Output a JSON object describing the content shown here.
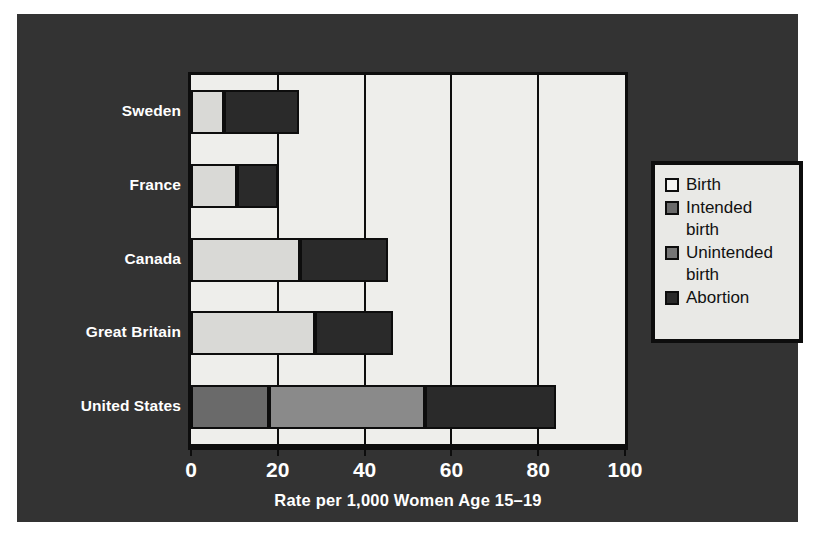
{
  "figure": {
    "background_color": "#ffffff",
    "panel_color": "#333333",
    "plot_background_color": "#eeeeeb",
    "axis_color": "#0d0d0d",
    "label_color": "#ffffff"
  },
  "axis": {
    "x_title": "Rate per 1,000 Women Age 15–19",
    "x_ticks": [
      "0",
      "20",
      "40",
      "60",
      "80",
      "100"
    ],
    "x_tick_values": [
      0,
      20,
      40,
      60,
      80,
      100
    ],
    "x_min": 0,
    "x_max": 100
  },
  "legend": {
    "items": [
      {
        "label": "Birth",
        "color": "#f4f4f2"
      },
      {
        "label": "Intended\nbirth",
        "color": "#6a6a6a"
      },
      {
        "label": "Unintended\nbirth",
        "color": "#767676"
      },
      {
        "label": "Abortion",
        "color": "#2a2a2a"
      }
    ]
  },
  "chart_data": {
    "type": "bar",
    "orientation": "horizontal",
    "stacked": true,
    "title": "",
    "xlabel": "Rate per 1,000 Women Age 15–19",
    "ylabel": "",
    "xlim": [
      0,
      100
    ],
    "grid": true,
    "legend_position": "right",
    "categories": [
      "Sweden",
      "France",
      "Canada",
      "Great Britain",
      "United States"
    ],
    "series": [
      {
        "name": "Birth",
        "color": "#f4f4f2",
        "values": [
          0,
          0,
          0,
          0,
          0
        ]
      },
      {
        "name": "Intended birth",
        "color": "#6a6a6a",
        "values": [
          0,
          0,
          0,
          0,
          18
        ]
      },
      {
        "name": "Unintended birth",
        "color": "#d9d9d6",
        "values": [
          7.5,
          10.5,
          25,
          28.5,
          36
        ]
      },
      {
        "name": "Abortion",
        "color": "#2a2a2a",
        "values": [
          17.5,
          9.5,
          20.5,
          18,
          30
        ]
      }
    ],
    "totals": [
      25,
      20,
      45.5,
      46.5,
      84
    ],
    "bars": [
      {
        "category": "Sweden",
        "segments": [
          {
            "name": "Unintended birth",
            "start": 0,
            "end": 7.5,
            "color": "#d9d9d6"
          },
          {
            "name": "Abortion",
            "start": 7.5,
            "end": 25,
            "color": "#2a2a2a"
          }
        ]
      },
      {
        "category": "France",
        "segments": [
          {
            "name": "Unintended birth",
            "start": 0,
            "end": 10.5,
            "color": "#d9d9d6"
          },
          {
            "name": "Abortion",
            "start": 10.5,
            "end": 20,
            "color": "#2a2a2a"
          }
        ]
      },
      {
        "category": "Canada",
        "segments": [
          {
            "name": "Unintended birth",
            "start": 0,
            "end": 25,
            "color": "#d9d9d6"
          },
          {
            "name": "Abortion",
            "start": 25,
            "end": 45.5,
            "color": "#2a2a2a"
          }
        ]
      },
      {
        "category": "Great Britain",
        "segments": [
          {
            "name": "Unintended birth",
            "start": 0,
            "end": 28.5,
            "color": "#d9d9d6"
          },
          {
            "name": "Abortion",
            "start": 28.5,
            "end": 46.5,
            "color": "#2a2a2a"
          }
        ]
      },
      {
        "category": "United States",
        "segments": [
          {
            "name": "Intended birth",
            "start": 0,
            "end": 18,
            "color": "#6a6a6a"
          },
          {
            "name": "Unintended birth",
            "start": 18,
            "end": 54,
            "color": "#8a8a8a"
          },
          {
            "name": "Abortion",
            "start": 54,
            "end": 84,
            "color": "#2a2a2a"
          }
        ]
      }
    ]
  }
}
